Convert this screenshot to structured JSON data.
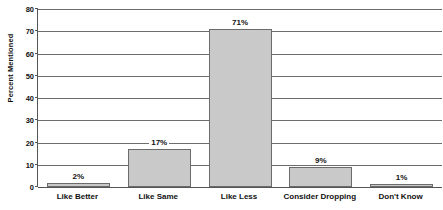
{
  "chart_data": {
    "type": "bar",
    "title": "",
    "xlabel": "",
    "ylabel": "Percent Mentioned",
    "categories": [
      "Like Better",
      "Like Same",
      "Like Less",
      "Consider Dropping",
      "Don't Know"
    ],
    "values": [
      2,
      17,
      71,
      9,
      1
    ],
    "value_labels": [
      "2%",
      "17%",
      "71%",
      "9%",
      "1%"
    ],
    "ylim": [
      0,
      80
    ],
    "yticks": [
      0,
      10,
      20,
      30,
      40,
      50,
      60,
      70,
      80
    ],
    "ytick_labels": [
      "0",
      "10",
      "20",
      "30",
      "40",
      "50",
      "60",
      "70",
      "80"
    ],
    "grid": true,
    "legend": "none",
    "bar_fill_color": "#c9c9c9",
    "bar_edge_color": "#6b6b6b",
    "axis_color": "#555555",
    "grid_color": "#6d6d6d"
  }
}
